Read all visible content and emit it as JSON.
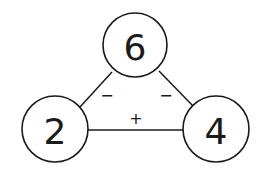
{
  "diagram": {
    "type": "number-triangle",
    "nodes": [
      {
        "id": "top",
        "value": "6",
        "cx": 135,
        "cy": 45,
        "r": 32
      },
      {
        "id": "left",
        "value": "2",
        "cx": 55,
        "cy": 129,
        "r": 33
      },
      {
        "id": "right",
        "value": "4",
        "cx": 216,
        "cy": 129,
        "r": 33
      }
    ],
    "edges": [
      {
        "from": "top",
        "to": "left",
        "operator": "−"
      },
      {
        "from": "top",
        "to": "right",
        "operator": "−"
      },
      {
        "from": "left",
        "to": "right",
        "operator": "+"
      }
    ]
  }
}
